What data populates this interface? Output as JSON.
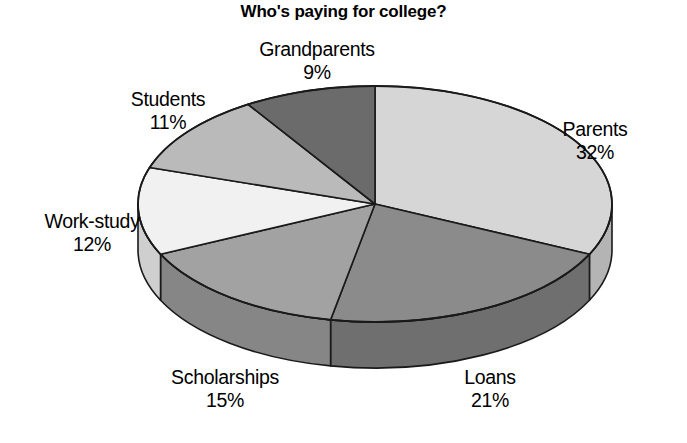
{
  "chart_data": {
    "type": "pie",
    "title": "Who's paying for college?",
    "xlabel": "",
    "ylabel": "",
    "legend_position": "none",
    "grid": false,
    "units": "%",
    "start_angle_deg": 0,
    "direction": "clockwise",
    "style": "3d-pie",
    "categories": [
      "Parents",
      "Loans",
      "Scholarships",
      "Work-study",
      "Students",
      "Grandparents"
    ],
    "values": [
      32,
      21,
      15,
      12,
      11,
      9
    ],
    "labels": [
      "32%",
      "21%",
      "15%",
      "12%",
      "11%",
      "9%"
    ],
    "slices": [
      {
        "name": "Parents",
        "value": 32,
        "label": "Parents",
        "pct": "32%",
        "color": "#d6d6d6",
        "side_color": "#b4b4b4"
      },
      {
        "name": "Loans",
        "value": 21,
        "label": "Loans",
        "pct": "21%",
        "color": "#8b8b8b",
        "side_color": "#6f6f6f"
      },
      {
        "name": "Scholarships",
        "value": 15,
        "label": "Scholarships",
        "pct": "15%",
        "color": "#a2a2a2",
        "side_color": "#868686"
      },
      {
        "name": "Work-study",
        "value": 12,
        "label": "Work-study",
        "pct": "12%",
        "color": "#f1f1f1",
        "side_color": "#cfcfcf"
      },
      {
        "name": "Students",
        "value": 11,
        "label": "Students",
        "pct": "11%",
        "color": "#bababa",
        "side_color": "#9a9a9a"
      },
      {
        "name": "Grandparents",
        "value": 9,
        "label": "Grandparents",
        "pct": "9%",
        "color": "#6b6b6b",
        "side_color": "#565656"
      }
    ],
    "outline_color": "#1a1a1a",
    "background_color": "#ffffff"
  }
}
